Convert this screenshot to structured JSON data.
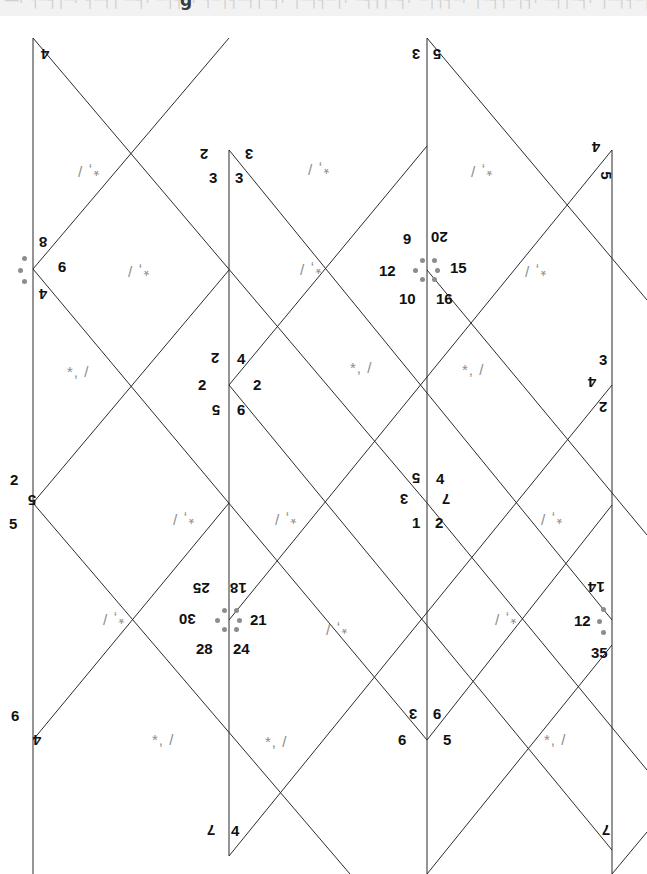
{
  "page": {
    "width": 647,
    "height": 874,
    "background": "#ffffff",
    "top_band": {
      "present": true,
      "background": "#f2f2f2",
      "ghost_text": "·—⌐┐─┤│─⌐┤─┐│└─┤⌐─│┤─⌐┐─│┤─┐│─┤⌐│─┐┤─│⌐─┤┐│─┤⌐─│┐┤─⌐│─┤┐─│┤⌐─┐│─┤⌐│─┐┤─│⌐─┤┐│─┤⌐─│┐┤─",
      "ghost_glyph": "g"
    }
  },
  "line_color": "#2b2b2b",
  "line_width": 1,
  "mark_color": "#8c8c8c",
  "label_color": "#111111",
  "orientation_marks": [
    {
      "id": "m1",
      "text": "*, /",
      "x": 95,
      "y": 172,
      "rotation": 180
    },
    {
      "id": "m2",
      "text": "*, /",
      "x": 145,
      "y": 272,
      "rotation": 180
    },
    {
      "id": "m3",
      "text": "*, /",
      "x": 325,
      "y": 170,
      "rotation": 180
    },
    {
      "id": "m4",
      "text": "*, /",
      "x": 317,
      "y": 270,
      "rotation": 180
    },
    {
      "id": "m5",
      "text": "*, /",
      "x": 488,
      "y": 172,
      "rotation": 180
    },
    {
      "id": "m6",
      "text": "*, /",
      "x": 542,
      "y": 272,
      "rotation": 180
    },
    {
      "id": "m7",
      "text": "*, /",
      "x": 85,
      "y": 372,
      "rotation": 0
    },
    {
      "id": "m8",
      "text": "*, /",
      "x": 368,
      "y": 368,
      "rotation": 0
    },
    {
      "id": "m9",
      "text": "*, /",
      "x": 480,
      "y": 370,
      "rotation": 0
    },
    {
      "id": "m10",
      "text": "*, /",
      "x": 190,
      "y": 520,
      "rotation": 180
    },
    {
      "id": "m11",
      "text": "*, /",
      "x": 292,
      "y": 520,
      "rotation": 180
    },
    {
      "id": "m12",
      "text": "*, /",
      "x": 558,
      "y": 520,
      "rotation": 180
    },
    {
      "id": "m13",
      "text": "*, /",
      "x": 120,
      "y": 620,
      "rotation": 180
    },
    {
      "id": "m14",
      "text": "*, /",
      "x": 343,
      "y": 630,
      "rotation": 180
    },
    {
      "id": "m15",
      "text": "*, /",
      "x": 512,
      "y": 620,
      "rotation": 180
    },
    {
      "id": "m16",
      "text": "*, /",
      "x": 170,
      "y": 740,
      "rotation": 0
    },
    {
      "id": "m17",
      "text": "*, /",
      "x": 283,
      "y": 742,
      "rotation": 0
    },
    {
      "id": "m18",
      "text": "*, /",
      "x": 562,
      "y": 740,
      "rotation": 0
    }
  ],
  "vertex_labels": [
    {
      "id": "v-tl-4",
      "text": "4",
      "x": 46,
      "y": 55,
      "rotation": 180
    },
    {
      "id": "v-tm-2",
      "text": "2",
      "x": 205,
      "y": 155,
      "rotation": 180
    },
    {
      "id": "v-tm-3a",
      "text": "3",
      "x": 214,
      "y": 178,
      "rotation": 0
    },
    {
      "id": "v-tm-3b",
      "text": "3",
      "x": 240,
      "y": 178,
      "rotation": 0
    },
    {
      "id": "v-tm-3c",
      "text": "3",
      "x": 250,
      "y": 155,
      "rotation": 180
    },
    {
      "id": "v-top-3",
      "text": "3",
      "x": 417,
      "y": 55,
      "rotation": 180
    },
    {
      "id": "v-top-5",
      "text": "5",
      "x": 438,
      "y": 55,
      "rotation": 180
    },
    {
      "id": "v-tr-4",
      "text": "4",
      "x": 597,
      "y": 148,
      "rotation": 180
    },
    {
      "id": "v-tr-5",
      "text": "5",
      "x": 607,
      "y": 176,
      "rotation": 90
    },
    {
      "id": "v-l-8",
      "text": "8",
      "x": 44,
      "y": 243,
      "rotation": 180
    },
    {
      "id": "v-l-9",
      "text": "9",
      "x": 63,
      "y": 268,
      "rotation": 180
    },
    {
      "id": "v-l-4",
      "text": "4",
      "x": 44,
      "y": 295,
      "rotation": 180
    },
    {
      "id": "v-c1-6",
      "text": "6",
      "x": 408,
      "y": 240,
      "rotation": 180
    },
    {
      "id": "v-c1-20",
      "text": "20",
      "x": 441,
      "y": 238,
      "rotation": 180
    },
    {
      "id": "v-c1-12",
      "text": "12",
      "x": 389,
      "y": 271,
      "rotation": 0
    },
    {
      "id": "v-c1-15",
      "text": "15",
      "x": 460,
      "y": 268,
      "rotation": 0
    },
    {
      "id": "v-c1-10",
      "text": "10",
      "x": 409,
      "y": 299,
      "rotation": 0
    },
    {
      "id": "v-c1-16",
      "text": "16",
      "x": 446,
      "y": 299,
      "rotation": 0
    },
    {
      "id": "v-c2-2a",
      "text": "2",
      "x": 216,
      "y": 359,
      "rotation": 180
    },
    {
      "id": "v-c2-4",
      "text": "4",
      "x": 242,
      "y": 359,
      "rotation": 0
    },
    {
      "id": "v-c2-2b",
      "text": "2",
      "x": 203,
      "y": 385,
      "rotation": 0
    },
    {
      "id": "v-c2-2c",
      "text": "2",
      "x": 258,
      "y": 385,
      "rotation": 0
    },
    {
      "id": "v-c2-5",
      "text": "5",
      "x": 217,
      "y": 411,
      "rotation": 180
    },
    {
      "id": "v-c2-9",
      "text": "9",
      "x": 242,
      "y": 411,
      "rotation": 180
    },
    {
      "id": "v-r1-3",
      "text": "3",
      "x": 604,
      "y": 360,
      "rotation": 0
    },
    {
      "id": "v-r1-4",
      "text": "4",
      "x": 593,
      "y": 383,
      "rotation": 180
    },
    {
      "id": "v-r1-2",
      "text": "2",
      "x": 604,
      "y": 408,
      "rotation": 180
    },
    {
      "id": "v-lm-2",
      "text": "2",
      "x": 15,
      "y": 480,
      "rotation": 0
    },
    {
      "id": "v-lm-5a",
      "text": "5",
      "x": 33,
      "y": 501,
      "rotation": 180
    },
    {
      "id": "v-lm-5b",
      "text": "5",
      "x": 14,
      "y": 524,
      "rotation": 0
    },
    {
      "id": "v-c3-5",
      "text": "5",
      "x": 417,
      "y": 479,
      "rotation": 180
    },
    {
      "id": "v-c3-4",
      "text": "4",
      "x": 441,
      "y": 479,
      "rotation": 0
    },
    {
      "id": "v-c3-3",
      "text": "3",
      "x": 405,
      "y": 500,
      "rotation": 180
    },
    {
      "id": "v-c3-7",
      "text": "7",
      "x": 447,
      "y": 500,
      "rotation": 180
    },
    {
      "id": "v-c3-1",
      "text": "1",
      "x": 417,
      "y": 523,
      "rotation": 0
    },
    {
      "id": "v-c3-2",
      "text": "2",
      "x": 440,
      "y": 523,
      "rotation": 0
    },
    {
      "id": "v-c4-25",
      "text": "25",
      "x": 203,
      "y": 589,
      "rotation": 180
    },
    {
      "id": "v-c4-18",
      "text": "18",
      "x": 240,
      "y": 589,
      "rotation": 180
    },
    {
      "id": "v-c4-30",
      "text": "30",
      "x": 189,
      "y": 620,
      "rotation": 180
    },
    {
      "id": "v-c4-21",
      "text": "21",
      "x": 260,
      "y": 620,
      "rotation": 0
    },
    {
      "id": "v-c4-28",
      "text": "28",
      "x": 206,
      "y": 649,
      "rotation": 0
    },
    {
      "id": "v-c4-24",
      "text": "24",
      "x": 243,
      "y": 649,
      "rotation": 0
    },
    {
      "id": "v-r2-14",
      "text": "14",
      "x": 598,
      "y": 588,
      "rotation": 180
    },
    {
      "id": "v-r2-12",
      "text": "12",
      "x": 584,
      "y": 621,
      "rotation": 0
    },
    {
      "id": "v-r2-35",
      "text": "35",
      "x": 601,
      "y": 653,
      "rotation": 0
    },
    {
      "id": "v-bl-6",
      "text": "6",
      "x": 16,
      "y": 716,
      "rotation": 0
    },
    {
      "id": "v-bl-4",
      "text": "4",
      "x": 38,
      "y": 741,
      "rotation": 180
    },
    {
      "id": "v-c5-3",
      "text": "3",
      "x": 414,
      "y": 715,
      "rotation": 180
    },
    {
      "id": "v-c5-9",
      "text": "9",
      "x": 438,
      "y": 715,
      "rotation": 180
    },
    {
      "id": "v-c5-6",
      "text": "6",
      "x": 403,
      "y": 740,
      "rotation": 0
    },
    {
      "id": "v-c5-5",
      "text": "5",
      "x": 448,
      "y": 740,
      "rotation": 0
    },
    {
      "id": "v-bm-7",
      "text": "7",
      "x": 212,
      "y": 831,
      "rotation": 180
    },
    {
      "id": "v-bm-4",
      "text": "4",
      "x": 236,
      "y": 831,
      "rotation": 0
    },
    {
      "id": "v-br-7",
      "text": "7",
      "x": 607,
      "y": 831,
      "rotation": 180
    }
  ],
  "vertex_dot_clusters": [
    {
      "id": "c-left",
      "cx": 33,
      "cy": 269,
      "count": 3
    },
    {
      "id": "c-center1",
      "cx": 427,
      "cy": 270,
      "count": 6
    },
    {
      "id": "c-center4",
      "cx": 229,
      "cy": 620,
      "count": 6
    },
    {
      "id": "c-right2",
      "cx": 612,
      "cy": 620,
      "count": 3
    }
  ]
}
